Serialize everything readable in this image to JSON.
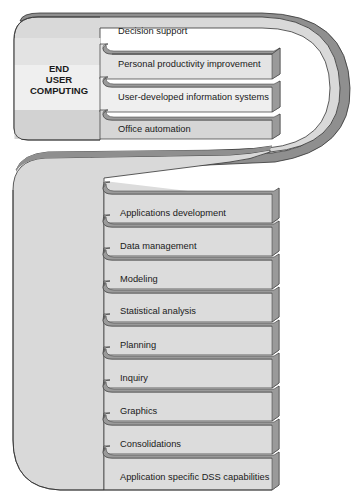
{
  "diagram": {
    "title_block": {
      "lines": [
        "END",
        "USER",
        "COMPUTING"
      ]
    },
    "end_user_computing_items": [
      {
        "label": "Decision support"
      },
      {
        "label": "Personal productivity improvement"
      },
      {
        "label": "User-developed information systems"
      },
      {
        "label": "Office automation"
      }
    ],
    "dss_capabilities": [
      {
        "label": "Applications development"
      },
      {
        "label": "Data management"
      },
      {
        "label": "Modeling"
      },
      {
        "label": "Statistical analysis"
      },
      {
        "label": "Planning"
      },
      {
        "label": "Inquiry"
      },
      {
        "label": "Graphics"
      },
      {
        "label": "Consolidations"
      },
      {
        "label": "Application specific DSS capabilities"
      }
    ],
    "colors": {
      "panel": "#dcdcdc",
      "panel_light": "#ececec",
      "panel_dark": "#c8c8c8",
      "edge": "#8a8a8a",
      "outline": "#333333"
    }
  }
}
